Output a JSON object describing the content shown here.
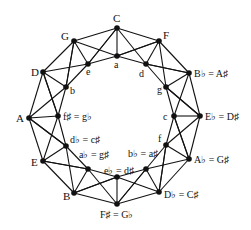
{
  "diagram": {
    "outer_nodes": [
      {
        "id": "C",
        "label": "C",
        "x": 117,
        "y": 28
      },
      {
        "id": "F",
        "label": "F",
        "x": 159,
        "y": 41
      },
      {
        "id": "Bb",
        "label": "B♭ = A♯",
        "x": 189,
        "y": 73
      },
      {
        "id": "Eb",
        "label": "E♭ = D♯",
        "x": 200,
        "y": 116
      },
      {
        "id": "Ab",
        "label": "A♭ = G♯",
        "x": 189,
        "y": 159
      },
      {
        "id": "Db",
        "label": "D♭ = C♯",
        "x": 159,
        "y": 192
      },
      {
        "id": "Fs",
        "label": "F♯ = G♭",
        "x": 117,
        "y": 204
      },
      {
        "id": "B",
        "label": "B",
        "x": 74,
        "y": 193
      },
      {
        "id": "E",
        "label": "E",
        "x": 43,
        "y": 161
      },
      {
        "id": "A",
        "label": "A",
        "x": 29,
        "y": 118
      },
      {
        "id": "D",
        "label": "D",
        "x": 43,
        "y": 72
      },
      {
        "id": "G",
        "label": "G",
        "x": 74,
        "y": 41
      }
    ],
    "inner_nodes": [
      {
        "id": "a",
        "label": "a",
        "x": 117,
        "y": 56
      },
      {
        "id": "d",
        "label": "d",
        "x": 146,
        "y": 64
      },
      {
        "id": "g",
        "label": "g",
        "x": 166,
        "y": 87
      },
      {
        "id": "c",
        "label": "c",
        "x": 174,
        "y": 116
      },
      {
        "id": "f",
        "label": "f",
        "x": 166,
        "y": 145
      },
      {
        "id": "bb",
        "label": "b♭ = a♯",
        "x": 146,
        "y": 169
      },
      {
        "id": "eb",
        "label": "e♭ = d♯",
        "x": 117,
        "y": 177
      },
      {
        "id": "ab",
        "label": "a♭ = g♯",
        "x": 88,
        "y": 169
      },
      {
        "id": "db",
        "label": "d♭ = c♯",
        "x": 66,
        "y": 146
      },
      {
        "id": "fs",
        "label": "f♯ = g♭",
        "x": 58,
        "y": 116
      },
      {
        "id": "b",
        "label": "b",
        "x": 66,
        "y": 87
      },
      {
        "id": "e",
        "label": "e",
        "x": 88,
        "y": 64
      }
    ]
  }
}
